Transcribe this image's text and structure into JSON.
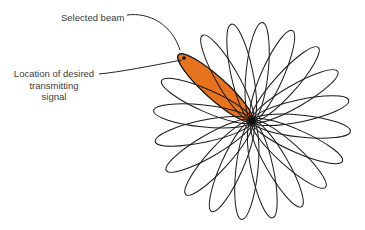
{
  "diagram": {
    "labels": {
      "selected_beam": "Selected beam",
      "location_line1": "Location of desired",
      "location_line2": "transmitting",
      "location_line3": "signal"
    },
    "beam_pattern": {
      "center": [
        252,
        121
      ],
      "petal_count": 20,
      "petal_length": 99,
      "petal_half_width": 11,
      "selected_angle_deg": 222,
      "selected_fill": "#e8731f",
      "stroke_color": "#1a1a1a"
    },
    "target_point": [
      184,
      58
    ]
  }
}
